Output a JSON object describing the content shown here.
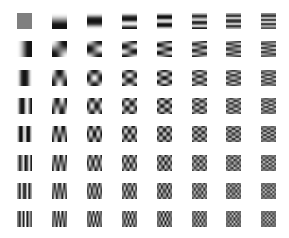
{
  "grid": {
    "rows": 8,
    "cols": 8,
    "cell_width": 15,
    "cell_height": 16,
    "origin_x": 17,
    "origin_y": 13,
    "step_x": 34.9,
    "step_y": 28.3,
    "block_size": 8,
    "background": "#ffffff",
    "dc_gray": "#7f7f7f",
    "description": "Row index = horizontal frequency u (0..7), column index = vertical frequency v (0..7)"
  }
}
